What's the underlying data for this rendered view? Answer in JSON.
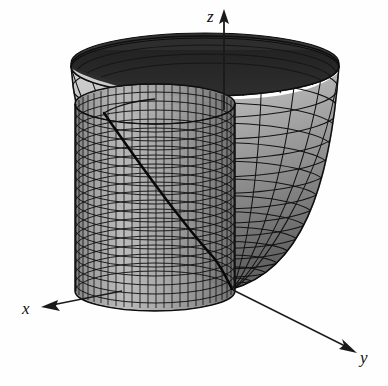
{
  "figure": {
    "title": "",
    "caption": "",
    "background_color": "#fefefe"
  },
  "axes": {
    "z": {
      "label": "z",
      "direction": "up",
      "arrow": true,
      "color": "#1a1a1a",
      "tail": {
        "x": 224,
        "y": 110
      },
      "tip": {
        "x": 224,
        "y": 12
      }
    },
    "x": {
      "label": "x",
      "direction": "down-left",
      "arrow": true,
      "color": "#1a1a1a",
      "tail": {
        "x": 120,
        "y": 292
      },
      "tip": {
        "x": 42,
        "y": 307
      }
    },
    "y": {
      "label": "y",
      "direction": "down-right",
      "arrow": true,
      "color": "#1a1a1a",
      "tail": {
        "x": 232,
        "y": 290
      },
      "tip": {
        "x": 355,
        "y": 352
      }
    }
  },
  "surfaces": [
    {
      "name": "paraboloid",
      "type": "paraboloid",
      "equation": "z = x^2 + y^2",
      "shading": {
        "inner_far_wall": "#2b2b2b",
        "inner_bowl_light": "#c6c6c6",
        "inner_bowl_mid": "#8d8d8d",
        "inner_bowl_dark": "#6a6a6a",
        "rim_band": "#3a3a3a"
      },
      "mesh": {
        "u_lines": 24,
        "v_lines": 14,
        "line_color": "#111111",
        "line_width": 1.0
      },
      "vertex": {
        "x": 232,
        "y": 289
      },
      "rim_center": {
        "x": 205,
        "y": 66
      },
      "rim_radius_x": 134,
      "rim_radius_y": 30
    },
    {
      "name": "cylinder",
      "type": "cylinder",
      "equation": "x^2 + y^2 = 1",
      "shading": {
        "light": "#c9c9c9",
        "mid": "#9c9c9c",
        "dark": "#6f6f6f"
      },
      "mesh": {
        "u_lines": 34,
        "v_lines": 22,
        "line_color": "#101010",
        "line_width": 0.9
      },
      "top_center": {
        "x": 155,
        "y": 104
      },
      "top_radius_x": 80,
      "top_radius_y": 20,
      "bottom_y": 291
    }
  ],
  "intersection_curve": {
    "name": "cylinder-paraboloid-intersection",
    "color": "#0a0a0a",
    "line_width": 2.6,
    "visible": true
  },
  "colors": {
    "ink": "#111111",
    "paper": "#fefefe",
    "dark_shade": "#2b2b2b",
    "light_shade": "#c6c6c6"
  }
}
